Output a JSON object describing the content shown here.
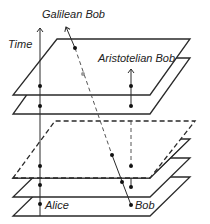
{
  "diagram": {
    "labels": {
      "time": "Time",
      "galilean_bob": "Galilean Bob",
      "aristotelian_bob": "Aristotelian Bob",
      "alice": "Alice",
      "bob": "Bob"
    },
    "planes": [
      {
        "name": "plane-top",
        "style": "solid"
      },
      {
        "name": "plane-2",
        "style": "solid"
      },
      {
        "name": "plane-3-dashed",
        "style": "dashed"
      },
      {
        "name": "plane-4",
        "style": "solid"
      },
      {
        "name": "plane-5",
        "style": "solid"
      },
      {
        "name": "plane-bottom",
        "style": "solid"
      }
    ],
    "colors": {
      "line": "#2a2a2a",
      "dashed_worldline": "#555555",
      "grey_dot": "#999999"
    }
  }
}
